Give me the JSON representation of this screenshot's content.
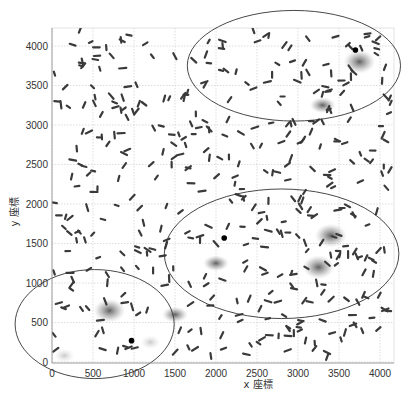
{
  "chart_data": {
    "type": "scatter",
    "title": "",
    "xlabel": "x 座標",
    "ylabel": "y 座標",
    "xlim": [
      0,
      4250
    ],
    "ylim": [
      0,
      4200
    ],
    "grid": true,
    "xticks": [
      0,
      500,
      1000,
      1500,
      2000,
      2500,
      3000,
      3500,
      4000
    ],
    "yticks": [
      0,
      500,
      1000,
      1500,
      2000,
      2500,
      3000,
      3500,
      4000
    ],
    "xtick_labels": [
      "0",
      "500",
      "1000",
      "1500",
      "2000",
      "2500",
      "3000",
      "3500",
      "4000"
    ],
    "ytick_labels": [
      "0",
      "500",
      "1000",
      "1500",
      "2000",
      "2500",
      "3000",
      "3500",
      "4000"
    ],
    "legend": null,
    "markers": "short dark dashes (elongated particles) scattered uniformly across the field",
    "highlighted_points": [
      {
        "x": 3700,
        "y": 3950,
        "label": "black dot (top-right cluster)"
      },
      {
        "x": 2100,
        "y": 1570,
        "label": "black dot (middle cluster)"
      },
      {
        "x": 970,
        "y": 270,
        "label": "black dot (bottom-left cluster)"
      }
    ],
    "density_blobs": [
      {
        "x": 3750,
        "y": 3800,
        "intensity": "high"
      },
      {
        "x": 3300,
        "y": 3250,
        "intensity": "medium"
      },
      {
        "x": 3400,
        "y": 1600,
        "intensity": "high"
      },
      {
        "x": 3250,
        "y": 1200,
        "intensity": "high"
      },
      {
        "x": 2000,
        "y": 1250,
        "intensity": "medium"
      },
      {
        "x": 1500,
        "y": 600,
        "intensity": "medium"
      },
      {
        "x": 700,
        "y": 650,
        "intensity": "high"
      },
      {
        "x": 1200,
        "y": 250,
        "intensity": "low"
      },
      {
        "x": 150,
        "y": 80,
        "intensity": "low"
      }
    ],
    "ellipses": [
      {
        "name": "top-right region",
        "cx": 2950,
        "cy": 3750,
        "rx": 1300,
        "ry": 700
      },
      {
        "name": "middle-right region",
        "cx": 2800,
        "cy": 1370,
        "rx": 1430,
        "ry": 820
      },
      {
        "name": "bottom-left region",
        "cx": 520,
        "cy": 480,
        "rx": 970,
        "ry": 690
      }
    ]
  }
}
